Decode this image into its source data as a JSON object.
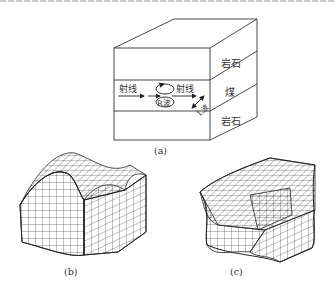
{
  "figure": {
    "panel_a": {
      "caption": "(a)",
      "layers": [
        {
          "label": "岩石"
        },
        {
          "label": "煤"
        },
        {
          "label": "岩石"
        }
      ],
      "ray_left_label": "射线",
      "ray_right_label": "射线",
      "rayleigh_label": "R波",
      "love_label": "L波"
    },
    "panel_b": {
      "caption": "(b)"
    },
    "panel_c": {
      "caption": "(c)"
    }
  }
}
